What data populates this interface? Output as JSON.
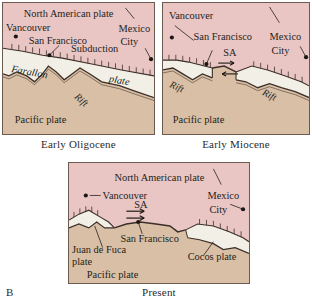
{
  "figure": {
    "letter": "B",
    "domain_type": "geologic-plate-tectonic-diagram",
    "colors": {
      "north_american_plate": "#e9c6c4",
      "farallon_plate": "#f2efe6",
      "pacific_plate": "#d9bfa5",
      "juan_de_fuca_plate": "#f2efe6",
      "cocos_plate": "#f2efe6",
      "boundary_line": "#3b2f28",
      "panel_border": "#6b5a4e",
      "text": "#241f1c",
      "page_background": "#ffffff"
    }
  },
  "panels": [
    {
      "id": "oligocene",
      "caption": "Early Oligocene",
      "labels": {
        "north_american_plate": "North American plate",
        "farallon": "Farallon",
        "farallon_plate_word": "plate",
        "pacific_plate": "Pacific plate",
        "subduction": "Subduction",
        "rift": "Rift"
      },
      "cities": [
        {
          "name": "Vancouver"
        },
        {
          "name": "San Francisco"
        },
        {
          "name": "Mexico City",
          "line1": "Mexico",
          "line2": "City"
        }
      ]
    },
    {
      "id": "miocene",
      "caption": "Early Miocene",
      "labels": {
        "pacific_plate": "Pacific plate",
        "rift_left": "Rift",
        "rift_right": "Rift",
        "san_andreas": "SA"
      },
      "cities": [
        {
          "name": "Vancouver"
        },
        {
          "name": "San Francisco"
        },
        {
          "name": "Mexico City",
          "line1": "Mexico",
          "line2": "City"
        }
      ]
    },
    {
      "id": "present",
      "caption": "Present",
      "labels": {
        "north_american_plate": "North American plate",
        "juan_de_fuca_line1": "Juan de Fuca",
        "juan_de_fuca_line2": "plate",
        "cocos_plate": "Cocos plate",
        "pacific_plate": "Pacific plate",
        "san_andreas": "SA"
      },
      "cities": [
        {
          "name": "Vancouver"
        },
        {
          "name": "San Francisco"
        },
        {
          "name": "Mexico City",
          "line1": "Mexico",
          "line2": "City"
        }
      ]
    }
  ]
}
